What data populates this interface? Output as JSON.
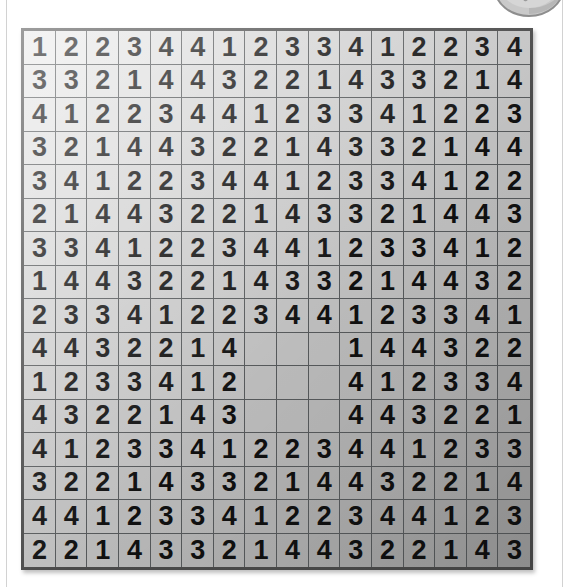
{
  "page": {
    "background_color": "#ffffff",
    "rule_color": "#d2d2d2"
  },
  "tool_badge": {
    "name": "pencil-tools-badge",
    "label": "pencils",
    "body_color": "#c9c9c9",
    "shade_color": "#a8a8a8",
    "outline_color": "#8e8e8e"
  },
  "grid": {
    "name": "number-grid",
    "rows": 16,
    "columns": 16,
    "border_color": "#4a4a4a",
    "cell_line_color": "#55585a",
    "light_cell_color": "#e9e9e9",
    "dark_cell_color": "#9a9a9a",
    "digit_color": "#101010",
    "blank_region": {
      "row_start": 10,
      "row_end": 12,
      "column_start": 8,
      "column_end": 10,
      "label": "empty-cells"
    },
    "values": [
      [
        "1",
        "2",
        "2",
        "3",
        "4",
        "4",
        "1",
        "2",
        "3",
        "3",
        "4",
        "1",
        "2",
        "2",
        "3",
        "4"
      ],
      [
        "3",
        "3",
        "2",
        "1",
        "4",
        "4",
        "3",
        "2",
        "2",
        "1",
        "4",
        "3",
        "3",
        "2",
        "1",
        "4"
      ],
      [
        "4",
        "1",
        "2",
        "2",
        "3",
        "4",
        "4",
        "1",
        "2",
        "3",
        "3",
        "4",
        "1",
        "2",
        "2",
        "3"
      ],
      [
        "3",
        "2",
        "1",
        "4",
        "4",
        "3",
        "2",
        "2",
        "1",
        "4",
        "3",
        "3",
        "2",
        "1",
        "4",
        "4"
      ],
      [
        "3",
        "4",
        "1",
        "2",
        "2",
        "3",
        "4",
        "4",
        "1",
        "2",
        "3",
        "3",
        "4",
        "1",
        "2",
        "2"
      ],
      [
        "2",
        "1",
        "4",
        "4",
        "3",
        "2",
        "2",
        "1",
        "4",
        "3",
        "3",
        "2",
        "1",
        "4",
        "4",
        "3"
      ],
      [
        "3",
        "3",
        "4",
        "1",
        "2",
        "2",
        "3",
        "4",
        "4",
        "1",
        "2",
        "3",
        "3",
        "4",
        "1",
        "2"
      ],
      [
        "1",
        "4",
        "4",
        "3",
        "2",
        "2",
        "1",
        "4",
        "3",
        "3",
        "2",
        "1",
        "4",
        "4",
        "3",
        "2"
      ],
      [
        "2",
        "3",
        "3",
        "4",
        "1",
        "2",
        "2",
        "3",
        "4",
        "4",
        "1",
        "2",
        "3",
        "3",
        "4",
        "1"
      ],
      [
        "4",
        "4",
        "3",
        "2",
        "2",
        "1",
        "4",
        "",
        "",
        "",
        "1",
        "4",
        "4",
        "3",
        "2",
        "2"
      ],
      [
        "1",
        "2",
        "3",
        "3",
        "4",
        "1",
        "2",
        "",
        "",
        "",
        "4",
        "1",
        "2",
        "3",
        "3",
        "4"
      ],
      [
        "4",
        "3",
        "2",
        "2",
        "1",
        "4",
        "3",
        "",
        "",
        "",
        "4",
        "4",
        "3",
        "2",
        "2",
        "1"
      ],
      [
        "4",
        "1",
        "2",
        "3",
        "3",
        "4",
        "1",
        "2",
        "2",
        "3",
        "4",
        "4",
        "1",
        "2",
        "3",
        "3"
      ],
      [
        "3",
        "2",
        "2",
        "1",
        "4",
        "3",
        "3",
        "2",
        "1",
        "4",
        "4",
        "3",
        "2",
        "2",
        "1",
        "4"
      ],
      [
        "4",
        "4",
        "1",
        "2",
        "3",
        "3",
        "4",
        "1",
        "2",
        "2",
        "3",
        "4",
        "4",
        "1",
        "2",
        "3"
      ],
      [
        "2",
        "2",
        "1",
        "4",
        "3",
        "3",
        "2",
        "1",
        "4",
        "4",
        "3",
        "2",
        "2",
        "1",
        "4",
        "3"
      ]
    ]
  }
}
